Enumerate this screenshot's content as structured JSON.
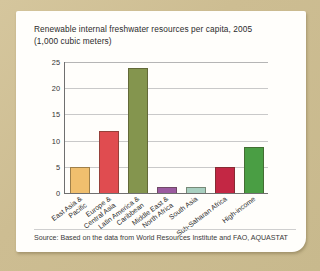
{
  "card": {
    "title_line1": "Renewable internal freshwater resources per capita, 2005",
    "title_line2": "(1,000 cubic meters)",
    "source": "Source: Based on the data from World Resources Institute and FAO, AQUASTAT"
  },
  "chart_data": {
    "type": "bar",
    "title": "Renewable internal freshwater resources per capita, 2005 (1,000 cubic meters)",
    "xlabel": "",
    "ylabel": "",
    "ylim": [
      0,
      25
    ],
    "yticks": [
      0,
      5,
      10,
      15,
      20,
      25
    ],
    "grid": true,
    "legend": "none",
    "categories": [
      "East Asia &\nPacific",
      "Europe &\nCentral Asia",
      "Latin America &\nCaribbean",
      "Middle East &\nNorth Africa",
      "South Asia",
      "Sub-Saharan Africa",
      "High-income"
    ],
    "category_labels": [
      [
        "East Asia &",
        "Pacific"
      ],
      [
        "Europe &",
        "Central Asia"
      ],
      [
        "Latin America &",
        "Caribbean"
      ],
      [
        "Middle East &",
        "North Africa"
      ],
      [
        "South Asia"
      ],
      [
        "Sub-Saharan Africa"
      ],
      [
        "High-income"
      ]
    ],
    "values": [
      5.0,
      11.9,
      23.9,
      1.1,
      1.2,
      5.0,
      8.8
    ],
    "colors": [
      "#f0bf6e",
      "#e04c50",
      "#84954e",
      "#9b5ba0",
      "#a8cfc0",
      "#c32744",
      "#4a9e44"
    ]
  },
  "theme": {
    "frame": "#cdbd92",
    "card": "#fffefb",
    "axis": "#6f6f6f",
    "grid": "#c9c9c9"
  }
}
